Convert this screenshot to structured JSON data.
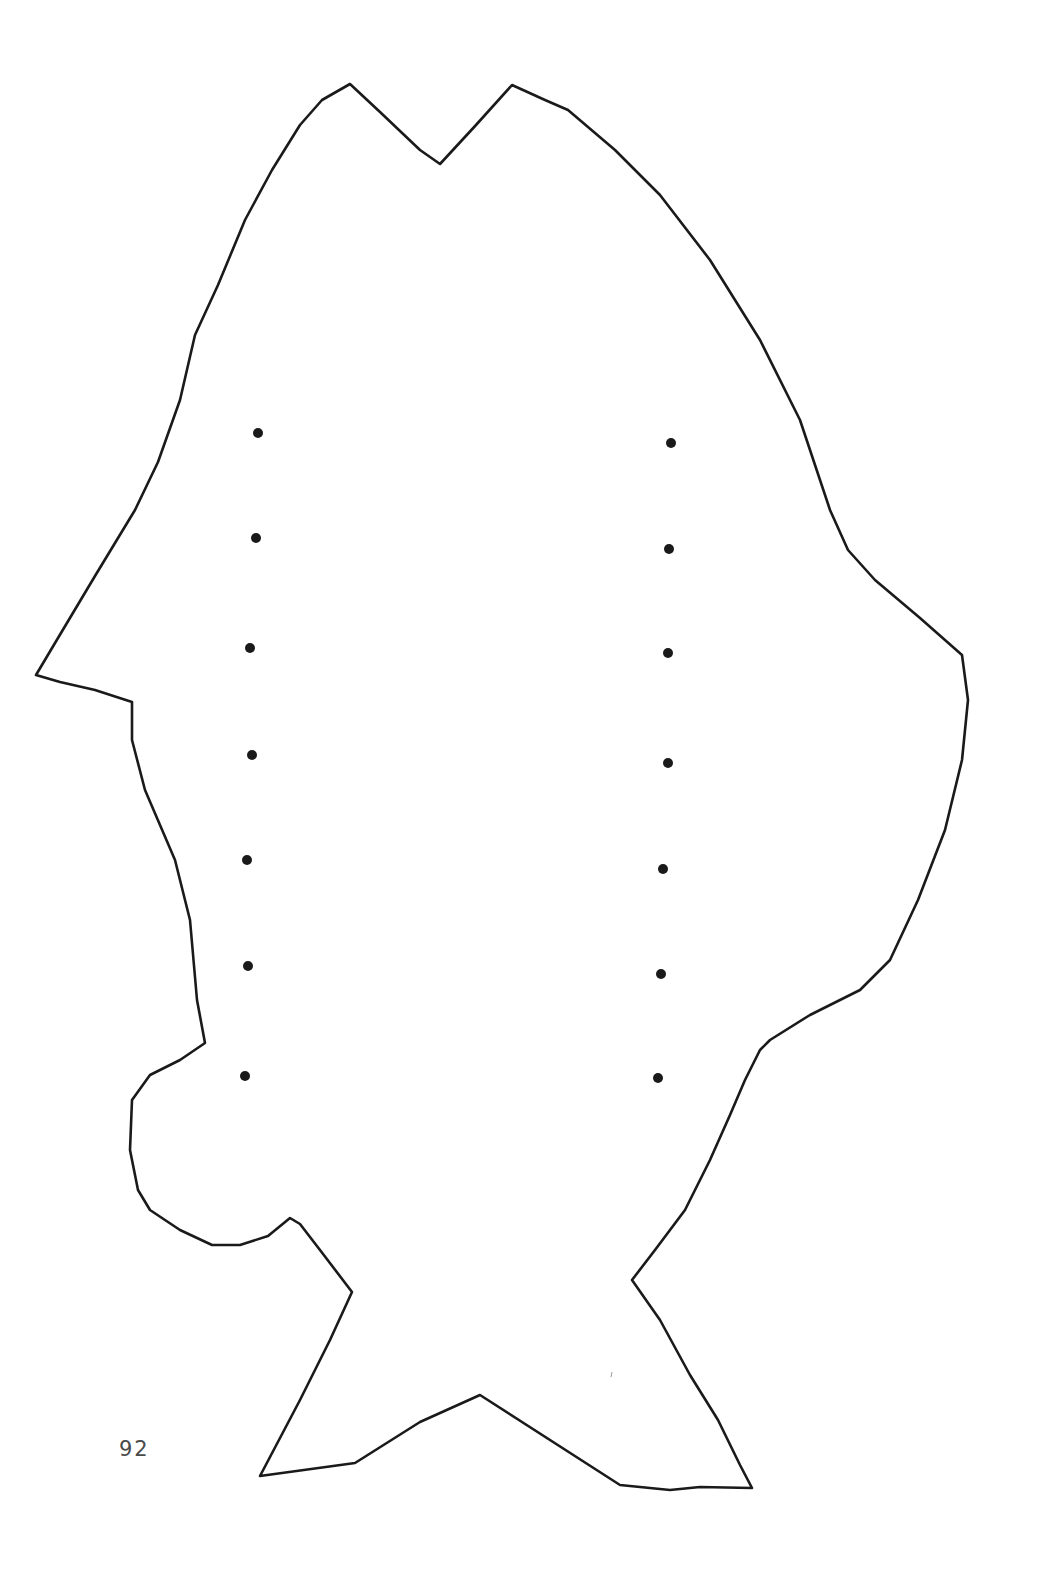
{
  "page": {
    "number": "92",
    "background": "#ffffff",
    "line_color": "#1a1a1a"
  },
  "figure": {
    "outline_path": "M 36 675 L 58 638 L 95 576 L 135 510 L 158 462 L 180 400 L 195 335 L 218 285 L 245 220 L 272 170 L 300 125 L 322 100 L 350 84 L 380 112 L 420 150 L 440 164 L 476 125 L 512 85 L 545 100 L 568 110 L 615 150 L 660 195 L 710 260 L 760 340 L 800 420 L 830 510 L 848 550 L 875 580 L 920 618 L 962 655 L 968 700 L 962 760 L 945 830 L 918 900 L 890 960 L 860 990 L 810 1015 L 770 1040 L 760 1050 L 745 1080 L 730 1115 L 710 1160 L 685 1210 L 655 1250 L 632 1280 L 660 1320 L 690 1375 L 718 1420 L 740 1465 L 752 1488 L 700 1487 L 670 1490 L 620 1485 L 480 1395 L 420 1422 L 355 1463 L 260 1476 L 300 1400 L 330 1340 L 352 1292 L 320 1250 L 300 1224 L 290 1218 L 268 1236 L 240 1245 L 212 1245 L 180 1230 L 150 1210 L 138 1190 L 130 1150 L 132 1100 L 150 1075 L 180 1060 L 205 1043 L 197 1000 L 190 920 L 175 860 L 145 790 L 132 740 L 132 702 L 95 690 L 60 682 Z",
    "dots_left": [
      {
        "x": 258,
        "y": 433
      },
      {
        "x": 256,
        "y": 538
      },
      {
        "x": 250,
        "y": 648
      },
      {
        "x": 252,
        "y": 755
      },
      {
        "x": 247,
        "y": 860
      },
      {
        "x": 248,
        "y": 966
      },
      {
        "x": 245,
        "y": 1076
      }
    ],
    "dots_right": [
      {
        "x": 671,
        "y": 443
      },
      {
        "x": 669,
        "y": 549
      },
      {
        "x": 668,
        "y": 653
      },
      {
        "x": 668,
        "y": 763
      },
      {
        "x": 663,
        "y": 869
      },
      {
        "x": 661,
        "y": 974
      },
      {
        "x": 658,
        "y": 1078
      }
    ],
    "stray_mark": {
      "x": 611,
      "y": 1374
    }
  }
}
